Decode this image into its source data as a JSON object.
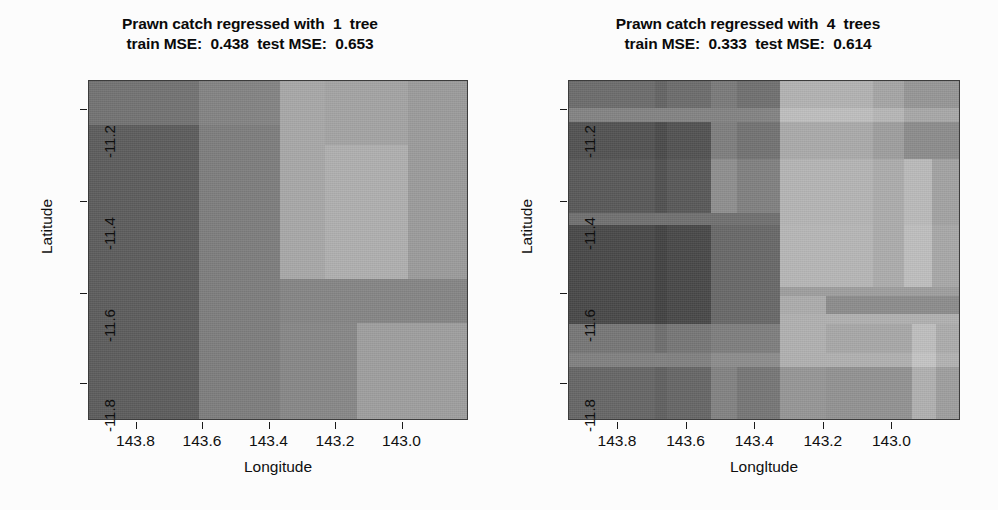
{
  "figure": {
    "background": "#fcfcfc",
    "panel_count": 2
  },
  "panels": [
    {
      "id": "left",
      "title_line1": "Prawn catch regressed with  1  tree",
      "title_line2": "train MSE:  0.438  test MSE:  0.653",
      "n_trees": 1,
      "train_mse": 0.438,
      "test_mse": 0.653,
      "xlabel": "Longitude",
      "ylabel": "Latitude"
    },
    {
      "id": "right",
      "title_line1": "Prawn catch regressed with  4  trees",
      "title_line2": "train MSE:  0.333  test MSE:  0.614",
      "n_trees": 4,
      "train_mse": 0.333,
      "test_mse": 0.614,
      "xlabel": "Longltude",
      "ylabel": "Latitude"
    }
  ],
  "axes": {
    "x_ticks": [
      "143.8",
      "143.6",
      "143.4",
      "143.2",
      "143.0"
    ],
    "x_tick_positions_pct": [
      12.5,
      30.0,
      47.5,
      65.0,
      82.5
    ],
    "y_ticks": [
      "-11.2",
      "-11.4",
      "-11.6",
      "-11.8"
    ],
    "y_tick_positions_pct": [
      8.5,
      35.5,
      62.5,
      89.0
    ]
  },
  "chart_data": [
    {
      "type": "heatmap",
      "panel": "left",
      "title": "Prawn catch regressed with  1  tree",
      "subtitle": "train MSE:  0.438  test MSE:  0.653",
      "xlabel": "Longitude",
      "ylabel": "Latitude",
      "xlim": [
        143.9,
        142.9
      ],
      "ylim": [
        -11.9,
        -11.1
      ],
      "colormap": "grayscale",
      "grid": false,
      "legend": "none",
      "note": "Piecewise-constant regression-tree prediction surface; rectangles are tree leaf regions. Values given as 0-255 grayscale level (darker = lower predicted catch).",
      "cells": [
        {
          "x_pct": 0.0,
          "y_pct": 0.0,
          "w_pct": 29.0,
          "h_pct": 13.0,
          "gray": 114
        },
        {
          "x_pct": 0.0,
          "y_pct": 13.0,
          "w_pct": 29.0,
          "h_pct": 87.0,
          "gray": 92
        },
        {
          "x_pct": 29.0,
          "y_pct": 0.0,
          "w_pct": 21.5,
          "h_pct": 13.0,
          "gray": 131
        },
        {
          "x_pct": 29.0,
          "y_pct": 13.0,
          "w_pct": 21.5,
          "h_pct": 87.0,
          "gray": 125
        },
        {
          "x_pct": 50.5,
          "y_pct": 0.0,
          "w_pct": 12.0,
          "h_pct": 58.5,
          "gray": 168
        },
        {
          "x_pct": 62.5,
          "y_pct": 0.0,
          "w_pct": 22.0,
          "h_pct": 19.0,
          "gray": 163
        },
        {
          "x_pct": 62.5,
          "y_pct": 19.0,
          "w_pct": 22.0,
          "h_pct": 39.5,
          "gray": 175
        },
        {
          "x_pct": 84.5,
          "y_pct": 0.0,
          "w_pct": 15.5,
          "h_pct": 58.5,
          "gray": 155
        },
        {
          "x_pct": 50.5,
          "y_pct": 58.5,
          "w_pct": 49.5,
          "h_pct": 13.0,
          "gray": 133
        },
        {
          "x_pct": 50.5,
          "y_pct": 71.5,
          "w_pct": 20.5,
          "h_pct": 28.5,
          "gray": 135
        },
        {
          "x_pct": 71.0,
          "y_pct": 71.5,
          "w_pct": 29.0,
          "h_pct": 28.5,
          "gray": 158
        }
      ]
    },
    {
      "type": "heatmap",
      "panel": "right",
      "title": "Prawn catch regressed with  4  trees",
      "subtitle": "train MSE:  0.333  test MSE:  0.614",
      "xlabel": "Longltude",
      "ylabel": "Latitude",
      "xlim": [
        143.9,
        142.9
      ],
      "ylim": [
        -11.9,
        -11.1
      ],
      "colormap": "grayscale",
      "grid": false,
      "legend": "none",
      "note": "Averaged prediction surface of 4 regression trees; finer banded structure from overlapping leaf boundaries. Values are 0-255 grayscale levels.",
      "cells": [
        {
          "x_pct": 0.0,
          "y_pct": 0.0,
          "w_pct": 22.0,
          "h_pct": 8.0,
          "gray": 108
        },
        {
          "x_pct": 22.0,
          "y_pct": 0.0,
          "w_pct": 3.0,
          "h_pct": 8.0,
          "gray": 100
        },
        {
          "x_pct": 25.0,
          "y_pct": 0.0,
          "w_pct": 11.5,
          "h_pct": 8.0,
          "gray": 108
        },
        {
          "x_pct": 36.5,
          "y_pct": 0.0,
          "w_pct": 6.5,
          "h_pct": 8.0,
          "gray": 122
        },
        {
          "x_pct": 43.0,
          "y_pct": 0.0,
          "w_pct": 11.0,
          "h_pct": 8.0,
          "gray": 112
        },
        {
          "x_pct": 54.0,
          "y_pct": 0.0,
          "w_pct": 24.0,
          "h_pct": 8.0,
          "gray": 178
        },
        {
          "x_pct": 78.0,
          "y_pct": 0.0,
          "w_pct": 8.0,
          "h_pct": 8.0,
          "gray": 165
        },
        {
          "x_pct": 86.0,
          "y_pct": 0.0,
          "w_pct": 14.0,
          "h_pct": 8.0,
          "gray": 150
        },
        {
          "x_pct": 0.0,
          "y_pct": 8.0,
          "w_pct": 54.0,
          "h_pct": 4.0,
          "gray": 131
        },
        {
          "x_pct": 54.0,
          "y_pct": 8.0,
          "w_pct": 24.0,
          "h_pct": 4.0,
          "gray": 190
        },
        {
          "x_pct": 78.0,
          "y_pct": 8.0,
          "w_pct": 8.0,
          "h_pct": 4.0,
          "gray": 182
        },
        {
          "x_pct": 86.0,
          "y_pct": 8.0,
          "w_pct": 14.0,
          "h_pct": 4.0,
          "gray": 168
        },
        {
          "x_pct": 0.0,
          "y_pct": 12.0,
          "w_pct": 22.0,
          "h_pct": 11.0,
          "gray": 82
        },
        {
          "x_pct": 22.0,
          "y_pct": 12.0,
          "w_pct": 3.0,
          "h_pct": 11.0,
          "gray": 74
        },
        {
          "x_pct": 25.0,
          "y_pct": 12.0,
          "w_pct": 11.5,
          "h_pct": 11.0,
          "gray": 82
        },
        {
          "x_pct": 36.5,
          "y_pct": 12.0,
          "w_pct": 6.5,
          "h_pct": 11.0,
          "gray": 126
        },
        {
          "x_pct": 43.0,
          "y_pct": 12.0,
          "w_pct": 11.0,
          "h_pct": 11.0,
          "gray": 114
        },
        {
          "x_pct": 54.0,
          "y_pct": 12.0,
          "w_pct": 24.0,
          "h_pct": 11.0,
          "gray": 170
        },
        {
          "x_pct": 78.0,
          "y_pct": 12.0,
          "w_pct": 8.0,
          "h_pct": 11.0,
          "gray": 158
        },
        {
          "x_pct": 86.0,
          "y_pct": 12.0,
          "w_pct": 14.0,
          "h_pct": 11.0,
          "gray": 140
        },
        {
          "x_pct": 0.0,
          "y_pct": 23.0,
          "w_pct": 22.0,
          "h_pct": 16.0,
          "gray": 88
        },
        {
          "x_pct": 22.0,
          "y_pct": 23.0,
          "w_pct": 3.0,
          "h_pct": 16.0,
          "gray": 80
        },
        {
          "x_pct": 25.0,
          "y_pct": 23.0,
          "w_pct": 11.5,
          "h_pct": 16.0,
          "gray": 88
        },
        {
          "x_pct": 36.5,
          "y_pct": 23.0,
          "w_pct": 6.5,
          "h_pct": 16.0,
          "gray": 142
        },
        {
          "x_pct": 43.0,
          "y_pct": 23.0,
          "w_pct": 11.0,
          "h_pct": 16.0,
          "gray": 128
        },
        {
          "x_pct": 54.0,
          "y_pct": 23.0,
          "w_pct": 24.0,
          "h_pct": 16.0,
          "gray": 180
        },
        {
          "x_pct": 78.0,
          "y_pct": 23.0,
          "w_pct": 8.0,
          "h_pct": 16.0,
          "gray": 172
        },
        {
          "x_pct": 86.0,
          "y_pct": 23.0,
          "w_pct": 7.0,
          "h_pct": 16.0,
          "gray": 186
        },
        {
          "x_pct": 93.0,
          "y_pct": 23.0,
          "w_pct": 7.0,
          "h_pct": 16.0,
          "gray": 162
        },
        {
          "x_pct": 0.0,
          "y_pct": 39.0,
          "w_pct": 54.0,
          "h_pct": 3.5,
          "gray": 112
        },
        {
          "x_pct": 54.0,
          "y_pct": 39.0,
          "w_pct": 24.0,
          "h_pct": 3.5,
          "gray": 180
        },
        {
          "x_pct": 78.0,
          "y_pct": 39.0,
          "w_pct": 8.0,
          "h_pct": 3.5,
          "gray": 172
        },
        {
          "x_pct": 86.0,
          "y_pct": 39.0,
          "w_pct": 7.0,
          "h_pct": 3.5,
          "gray": 186
        },
        {
          "x_pct": 93.0,
          "y_pct": 39.0,
          "w_pct": 7.0,
          "h_pct": 3.5,
          "gray": 162
        },
        {
          "x_pct": 0.0,
          "y_pct": 42.5,
          "w_pct": 22.0,
          "h_pct": 29.5,
          "gray": 72
        },
        {
          "x_pct": 22.0,
          "y_pct": 42.5,
          "w_pct": 3.0,
          "h_pct": 29.5,
          "gray": 66
        },
        {
          "x_pct": 25.0,
          "y_pct": 42.5,
          "w_pct": 11.5,
          "h_pct": 29.5,
          "gray": 72
        },
        {
          "x_pct": 36.5,
          "y_pct": 42.5,
          "w_pct": 17.5,
          "h_pct": 29.5,
          "gray": 104
        },
        {
          "x_pct": 54.0,
          "y_pct": 42.5,
          "w_pct": 24.0,
          "h_pct": 18.5,
          "gray": 182
        },
        {
          "x_pct": 78.0,
          "y_pct": 42.5,
          "w_pct": 8.0,
          "h_pct": 18.5,
          "gray": 172
        },
        {
          "x_pct": 86.0,
          "y_pct": 42.5,
          "w_pct": 7.0,
          "h_pct": 18.5,
          "gray": 190
        },
        {
          "x_pct": 93.0,
          "y_pct": 42.5,
          "w_pct": 7.0,
          "h_pct": 18.5,
          "gray": 168
        },
        {
          "x_pct": 54.0,
          "y_pct": 61.0,
          "w_pct": 46.0,
          "h_pct": 2.5,
          "gray": 158
        },
        {
          "x_pct": 54.0,
          "y_pct": 63.5,
          "w_pct": 12.0,
          "h_pct": 5.5,
          "gray": 172
        },
        {
          "x_pct": 66.0,
          "y_pct": 63.5,
          "w_pct": 34.0,
          "h_pct": 5.5,
          "gray": 140
        },
        {
          "x_pct": 54.0,
          "y_pct": 69.0,
          "w_pct": 46.0,
          "h_pct": 3.0,
          "gray": 176
        },
        {
          "x_pct": 0.0,
          "y_pct": 72.0,
          "w_pct": 22.0,
          "h_pct": 8.5,
          "gray": 118
        },
        {
          "x_pct": 22.0,
          "y_pct": 72.0,
          "w_pct": 3.0,
          "h_pct": 8.5,
          "gray": 110
        },
        {
          "x_pct": 25.0,
          "y_pct": 72.0,
          "w_pct": 11.5,
          "h_pct": 8.5,
          "gray": 118
        },
        {
          "x_pct": 36.5,
          "y_pct": 72.0,
          "w_pct": 17.5,
          "h_pct": 8.5,
          "gray": 126
        },
        {
          "x_pct": 54.0,
          "y_pct": 72.0,
          "w_pct": 12.0,
          "h_pct": 8.5,
          "gray": 176
        },
        {
          "x_pct": 66.0,
          "y_pct": 72.0,
          "w_pct": 22.0,
          "h_pct": 8.5,
          "gray": 168
        },
        {
          "x_pct": 88.0,
          "y_pct": 72.0,
          "w_pct": 6.0,
          "h_pct": 8.5,
          "gray": 190
        },
        {
          "x_pct": 94.0,
          "y_pct": 72.0,
          "w_pct": 6.0,
          "h_pct": 8.5,
          "gray": 172
        },
        {
          "x_pct": 0.0,
          "y_pct": 80.5,
          "w_pct": 36.5,
          "h_pct": 4.0,
          "gray": 128
        },
        {
          "x_pct": 36.5,
          "y_pct": 80.5,
          "w_pct": 17.5,
          "h_pct": 4.0,
          "gray": 140
        },
        {
          "x_pct": 54.0,
          "y_pct": 80.5,
          "w_pct": 34.0,
          "h_pct": 4.0,
          "gray": 176
        },
        {
          "x_pct": 88.0,
          "y_pct": 80.5,
          "w_pct": 6.0,
          "h_pct": 4.0,
          "gray": 196
        },
        {
          "x_pct": 94.0,
          "y_pct": 80.5,
          "w_pct": 6.0,
          "h_pct": 4.0,
          "gray": 178
        },
        {
          "x_pct": 0.0,
          "y_pct": 84.5,
          "w_pct": 22.0,
          "h_pct": 15.5,
          "gray": 102
        },
        {
          "x_pct": 22.0,
          "y_pct": 84.5,
          "w_pct": 3.0,
          "h_pct": 15.5,
          "gray": 96
        },
        {
          "x_pct": 25.0,
          "y_pct": 84.5,
          "w_pct": 11.5,
          "h_pct": 15.5,
          "gray": 102
        },
        {
          "x_pct": 36.5,
          "y_pct": 84.5,
          "w_pct": 6.5,
          "h_pct": 15.5,
          "gray": 130
        },
        {
          "x_pct": 43.0,
          "y_pct": 84.5,
          "w_pct": 11.0,
          "h_pct": 15.5,
          "gray": 118
        },
        {
          "x_pct": 54.0,
          "y_pct": 84.5,
          "w_pct": 12.0,
          "h_pct": 15.5,
          "gray": 150
        },
        {
          "x_pct": 66.0,
          "y_pct": 84.5,
          "w_pct": 22.0,
          "h_pct": 15.5,
          "gray": 146
        },
        {
          "x_pct": 88.0,
          "y_pct": 84.5,
          "w_pct": 6.0,
          "h_pct": 15.5,
          "gray": 176
        },
        {
          "x_pct": 94.0,
          "y_pct": 84.5,
          "w_pct": 6.0,
          "h_pct": 15.5,
          "gray": 158
        }
      ]
    }
  ]
}
